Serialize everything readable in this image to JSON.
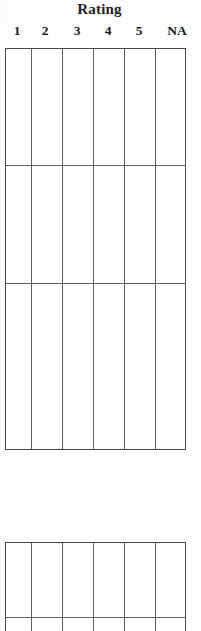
{
  "document": {
    "type": "rating-scale-form",
    "title": "Rating",
    "background_color": "#ffffff",
    "line_color": "#5e5e5e",
    "text_color": "#1a1a1a"
  },
  "header": {
    "title": "Rating",
    "columns": [
      {
        "label": "1",
        "center_x": 17,
        "left": 5,
        "width": 26
      },
      {
        "label": "2",
        "center_x": 45,
        "left": 31,
        "width": 31
      },
      {
        "label": "3",
        "center_x": 77,
        "left": 62,
        "width": 31
      },
      {
        "label": "4",
        "center_x": 108,
        "left": 93,
        "width": 31
      },
      {
        "label": "5",
        "center_x": 139,
        "left": 124,
        "width": 31
      },
      {
        "label": "NA",
        "center_x": 177,
        "left": 155,
        "width": 31
      }
    ]
  },
  "grids": [
    {
      "name": "primary-rating-grid",
      "left": 5,
      "top": 48,
      "width": 181,
      "height": 402,
      "column_edges": [
        5,
        31,
        62,
        93,
        124,
        155,
        186
      ],
      "row_edges": [
        48,
        165,
        283,
        450
      ],
      "rows": 3,
      "columns": 6,
      "cells": [
        [
          "",
          "",
          "",
          "",
          "",
          ""
        ],
        [
          "",
          "",
          "",
          "",
          "",
          ""
        ],
        [
          "",
          "",
          "",
          "",
          "",
          ""
        ]
      ]
    },
    {
      "name": "secondary-rating-grid",
      "left": 5,
      "top": 542,
      "width": 181,
      "height": 89,
      "column_edges": [
        5,
        31,
        62,
        93,
        124,
        155,
        186
      ],
      "row_edges": [
        542,
        617,
        631
      ],
      "rows": 2,
      "columns": 6,
      "clipped_at_bottom": true,
      "cells": [
        [
          "",
          "",
          "",
          "",
          "",
          ""
        ],
        [
          "",
          "",
          "",
          "",
          "",
          ""
        ]
      ]
    }
  ]
}
